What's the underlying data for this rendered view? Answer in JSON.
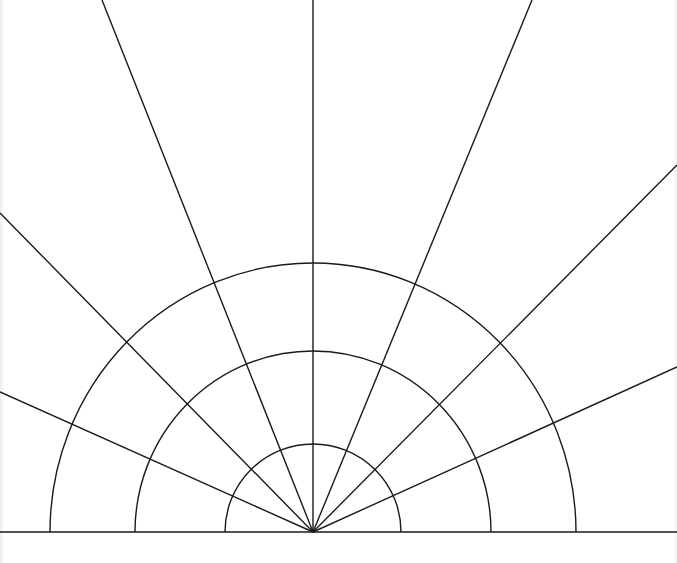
{
  "diagram": {
    "type": "polar-grid-semicircle",
    "stroke_color": "#1a1a1a",
    "background_color": "#ffffff",
    "origin": {
      "x": 313,
      "y": 532
    },
    "baseline": {
      "x1": 0,
      "y1": 532,
      "x2": 677,
      "y2": 532
    },
    "semicircles": [
      {
        "name": "inner",
        "rx": 88,
        "ry": 88
      },
      {
        "name": "middle",
        "rx": 178,
        "ry": 181
      },
      {
        "name": "outer",
        "rx": 263,
        "ry": 269
      }
    ],
    "radial_lines": [
      {
        "name": "ray-24-left",
        "x2": 0,
        "y2": 392
      },
      {
        "name": "ray-45-left",
        "x2": 0,
        "y2": 213
      },
      {
        "name": "ray-68-left",
        "x2": 102,
        "y2": 0
      },
      {
        "name": "ray-90",
        "x2": 313,
        "y2": 0
      },
      {
        "name": "ray-68-right",
        "x2": 532,
        "y2": 0
      },
      {
        "name": "ray-45-right",
        "x2": 677,
        "y2": 165
      },
      {
        "name": "ray-24-right",
        "x2": 677,
        "y2": 367
      }
    ]
  }
}
